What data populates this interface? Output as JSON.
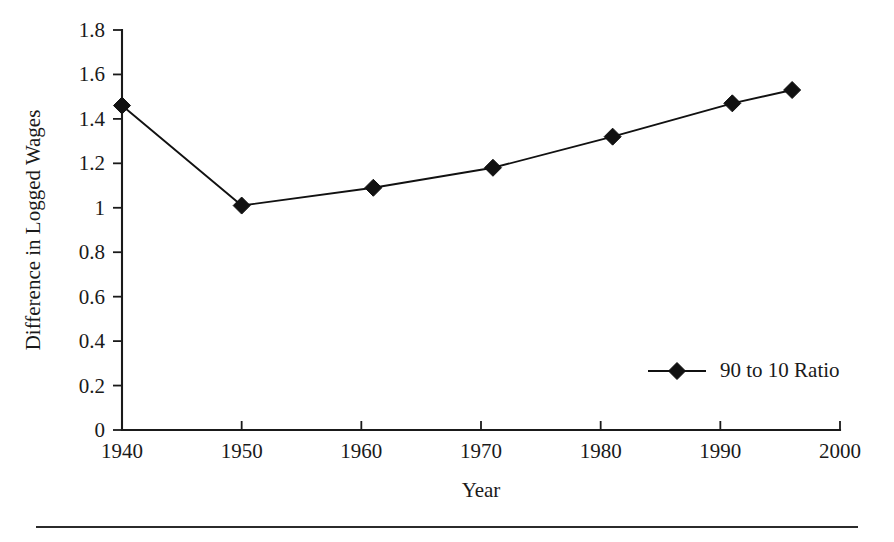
{
  "chart_data": {
    "type": "line",
    "title": "",
    "xlabel": "Year",
    "ylabel": "Difference in Logged Wages",
    "xlim": [
      1940,
      2000
    ],
    "ylim": [
      0,
      1.8
    ],
    "grid": false,
    "legend_position": "inside-right",
    "x_ticks": [
      "1940",
      "1950",
      "1960",
      "1970",
      "1980",
      "1990",
      "2000"
    ],
    "x_tick_values": [
      1940,
      1950,
      1960,
      1970,
      1980,
      1990,
      2000
    ],
    "y_ticks": [
      "0",
      "0.2",
      "0.4",
      "0.6",
      "0.8",
      "1",
      "1.2",
      "1.4",
      "1.6",
      "1.8"
    ],
    "y_tick_values": [
      0,
      0.2,
      0.4,
      0.6,
      0.8,
      1,
      1.2,
      1.4,
      1.6,
      1.8
    ],
    "series": [
      {
        "name": "90 to 10 Ratio",
        "marker": "diamond",
        "color": "#111111",
        "x": [
          1940,
          1950,
          1961,
          1971,
          1981,
          1991,
          1996
        ],
        "values": [
          1.46,
          1.01,
          1.09,
          1.18,
          1.32,
          1.47,
          1.53
        ]
      }
    ]
  },
  "legend": {
    "entries": [
      {
        "label": "90 to 10 Ratio",
        "marker": "diamond",
        "color": "#111111"
      }
    ]
  },
  "colors": {
    "line": "#111111",
    "axis": "#1a1a1a",
    "text": "#1a1a1a",
    "background": "#ffffff",
    "rule": "#2b2b2b"
  }
}
